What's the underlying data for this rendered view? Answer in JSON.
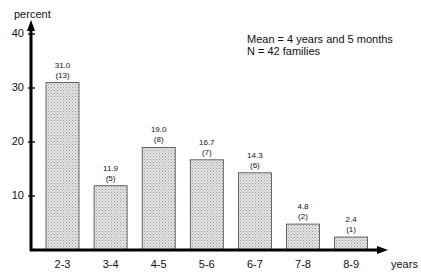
{
  "chart_data": {
    "type": "bar",
    "title": "",
    "xlabel": "years",
    "ylabel": "percent",
    "ylim": [
      0,
      40
    ],
    "yticks": [
      10,
      20,
      30,
      40
    ],
    "grid": false,
    "categories": [
      "2-3",
      "3-4",
      "4-5",
      "5-6",
      "6-7",
      "7-8",
      "8-9"
    ],
    "values": [
      31.0,
      11.9,
      19.0,
      16.7,
      14.3,
      4.8,
      2.4
    ],
    "counts": [
      13,
      5,
      8,
      7,
      6,
      2,
      1
    ],
    "value_labels": [
      "31.0",
      "11.9",
      "19.0",
      "16.7",
      "14.3",
      "4.8",
      "2.4"
    ],
    "count_labels": [
      "(13)",
      "(5)",
      "(8)",
      "(7)",
      "(6)",
      "(2)",
      "(1)"
    ],
    "annotations": [
      "Mean = 4 years and 5 months",
      "N = 42 families"
    ],
    "bar_fill": "stippled light gray"
  },
  "axis": {
    "y_title": "percent",
    "x_title": "years",
    "y_ticks": [
      "10",
      "20",
      "30",
      "40"
    ]
  },
  "annotation": {
    "line1": "Mean = 4 years and 5 months",
    "line2": "N = 42 families"
  }
}
